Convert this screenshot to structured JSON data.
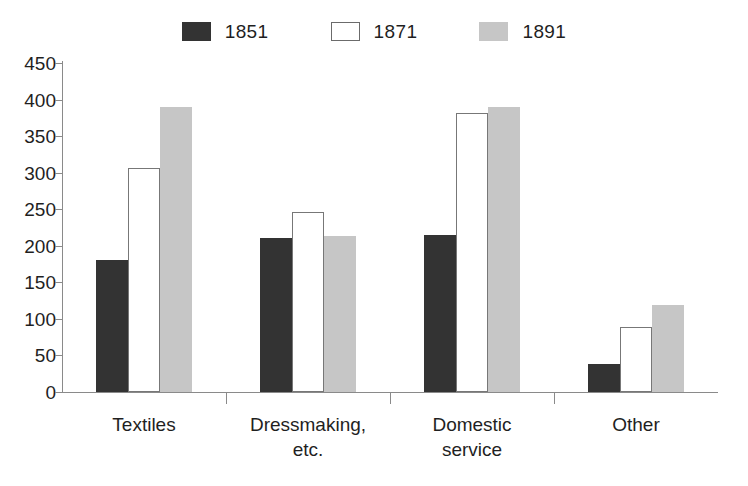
{
  "chart_data": {
    "type": "bar",
    "title": "",
    "subtitle": "",
    "xlabel": "",
    "ylabel": "",
    "ylim": [
      0,
      450
    ],
    "ytick_step": 50,
    "yticks": [
      0,
      50,
      100,
      150,
      200,
      250,
      300,
      350,
      400,
      450
    ],
    "ytick_labels": [
      "0",
      "50",
      "100",
      "150",
      "200",
      "250",
      "300",
      "350",
      "400",
      "450"
    ],
    "grid": false,
    "legend_position": "top-center",
    "categories": [
      "Textiles",
      "Dressmaking,\netc.",
      "Domestic\nservice",
      "Other"
    ],
    "category_labels_flat": [
      "Textiles",
      "Dressmaking, etc.",
      "Domestic service",
      "Other"
    ],
    "series": [
      {
        "name": "1851",
        "color": "#333333",
        "values": [
          180,
          211,
          215,
          38
        ]
      },
      {
        "name": "1871",
        "color": "#ffffff",
        "values": [
          307,
          246,
          381,
          89
        ]
      },
      {
        "name": "1891",
        "color": "#c6c6c6",
        "values": [
          390,
          214,
          390,
          119
        ]
      }
    ]
  },
  "legend": {
    "entries": [
      {
        "label": "1851",
        "swatch": "dark-filled-swatch"
      },
      {
        "label": "1871",
        "swatch": "white-outlined-swatch"
      },
      {
        "label": "1891",
        "swatch": "light-gray-swatch"
      }
    ]
  },
  "colors": {
    "series_1851": "#333333",
    "series_1871": "#ffffff",
    "series_1871_border": "#777777",
    "series_1891": "#c6c6c6",
    "axis": "#8a8a8a",
    "text": "#1f1f1f",
    "background": "#ffffff"
  }
}
